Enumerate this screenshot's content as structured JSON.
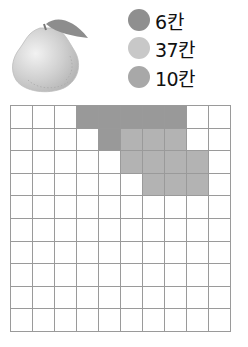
{
  "legend": {
    "items": [
      {
        "label": "6칸",
        "color": "#8f8f8f",
        "top": 0
      },
      {
        "label": "37칸",
        "color": "#c8c8c8",
        "top": 28
      },
      {
        "label": "10칸",
        "color": "#a8a8a8",
        "top": 57
      }
    ]
  },
  "grid": {
    "rows": 10,
    "cols": 10,
    "line_color": "#9a9a9a",
    "empty_color": "#ffffff",
    "fills": {
      "dark": {
        "color": "#999999",
        "cells": [
          [
            0,
            3
          ],
          [
            0,
            4
          ],
          [
            0,
            5
          ],
          [
            0,
            6
          ],
          [
            0,
            7
          ],
          [
            1,
            4
          ]
        ]
      },
      "medium": {
        "color": "#b3b3b3",
        "cells": [
          [
            1,
            5
          ],
          [
            1,
            6
          ],
          [
            1,
            7
          ],
          [
            2,
            5
          ],
          [
            2,
            6
          ],
          [
            2,
            7
          ],
          [
            2,
            8
          ],
          [
            3,
            6
          ],
          [
            3,
            7
          ],
          [
            3,
            8
          ]
        ]
      }
    }
  },
  "image": {
    "icon": "pear-fruit-icon"
  }
}
